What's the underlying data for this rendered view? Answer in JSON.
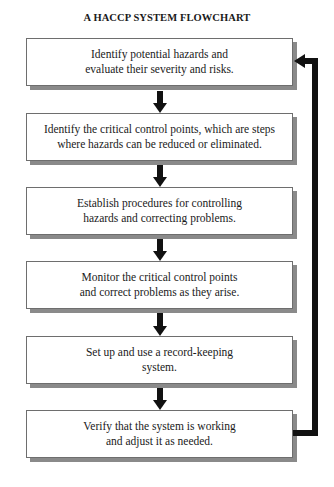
{
  "title": "A HACCP SYSTEM FLOWCHART",
  "steps": [
    {
      "text": "Identify potential hazards and\nevaluate their severity and risks."
    },
    {
      "text": "Identify the critical control points, which are steps\nwhere hazards can be reduced or eliminated."
    },
    {
      "text": "Establish procedures for controlling\nhazards and correcting problems."
    },
    {
      "text": "Monitor the critical control points\nand correct problems as they arise."
    },
    {
      "text": "Set up and use a record-keeping\nsystem."
    },
    {
      "text": "Verify that the system is working\nand adjust it as needed."
    }
  ],
  "colors": {
    "arrow": "#111111",
    "box_border": "#6e6e6e",
    "shadow": "#8a8a8a"
  }
}
